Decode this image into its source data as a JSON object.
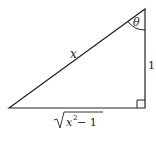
{
  "diagram": {
    "type": "right-triangle",
    "labels": {
      "angle": "θ",
      "hypotenuse": "x",
      "vertical_side": "1",
      "base_radicand_var": "x",
      "base_exponent": "2",
      "base_rest": " − 1"
    },
    "colors": {
      "stroke": "#222222",
      "background": "#ffffff"
    }
  }
}
